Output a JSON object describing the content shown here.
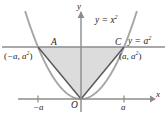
{
  "figure": {
    "colors": {
      "axis": "#8c8c8c",
      "parabola": "#a6a6a6",
      "chord": "#58595b",
      "hline": "#8c8c8c",
      "fill": "#dcdcdc",
      "text": "#231f20"
    },
    "labels": {
      "y_axis": "y",
      "x_axis": "x",
      "origin": "O",
      "point_a": "A",
      "point_c": "C",
      "curve_parabola_prefix": "y = x",
      "curve_parabola_exp": "2",
      "line_horizontal_prefix": "y = a",
      "line_horizontal_exp": "2",
      "coord_left_open": "(",
      "coord_left_x": "−a",
      "coord_left_sep": ", ",
      "coord_left_y": "a",
      "coord_left_y_exp": "2",
      "coord_left_close": ")",
      "coord_right_open": "(",
      "coord_right_x": "a",
      "coord_right_sep": ", ",
      "coord_right_y": "a",
      "coord_right_y_exp": "2",
      "coord_right_close": ")",
      "tick_neg_a": "−a",
      "tick_pos_a": "a"
    }
  },
  "chart_data": {
    "type": "line",
    "xlabel": "x",
    "ylabel": "y",
    "grid": false,
    "legend": "none",
    "xlim": [
      -1.45,
      1.45
    ],
    "ylim": [
      -0.18,
      1.85
    ],
    "series": [
      {
        "name": "y = x^2",
        "type": "line",
        "x": [
          -1.25,
          -1.0,
          -0.75,
          -0.5,
          -0.25,
          0.0,
          0.25,
          0.5,
          0.75,
          1.0,
          1.25
        ],
        "values": [
          1.5625,
          1.0,
          0.5625,
          0.25,
          0.0625,
          0.0,
          0.0625,
          0.25,
          0.5625,
          1.0,
          1.5625
        ]
      },
      {
        "name": "chord O to A",
        "type": "line",
        "x": [
          0.0,
          -1.0
        ],
        "values": [
          0.0,
          1.0
        ]
      },
      {
        "name": "chord O to C",
        "type": "line",
        "x": [
          0.0,
          1.0
        ],
        "values": [
          0.0,
          1.0
        ]
      },
      {
        "name": "y = a^2",
        "type": "line",
        "x": [
          -1.45,
          1.45
        ],
        "values": [
          1.0,
          1.0
        ]
      }
    ],
    "shaded_region": {
      "name": "triangle AOC",
      "vertices": [
        [
          -1.0,
          1.0
        ],
        [
          1.0,
          1.0
        ],
        [
          0.0,
          0.0
        ]
      ],
      "color": "#dcdcdc"
    },
    "annotations": [
      {
        "text": "A",
        "x": -1.0,
        "y": 1.0
      },
      {
        "text": "C",
        "x": 1.0,
        "y": 1.0
      },
      {
        "text": "O",
        "x": 0.0,
        "y": 0.0
      },
      {
        "text": "(−a, a^2)",
        "x": -1.0,
        "y": 1.0
      },
      {
        "text": "(a, a^2)",
        "x": 1.0,
        "y": 1.0
      },
      {
        "text": "y = x^2",
        "x": 0.42,
        "y": 1.62
      },
      {
        "text": "y = a^2",
        "x": 1.22,
        "y": 1.18
      }
    ],
    "xticks": [
      -1.0,
      0.0,
      1.0
    ],
    "xticklabels": [
      "−a",
      "O",
      "a"
    ]
  }
}
